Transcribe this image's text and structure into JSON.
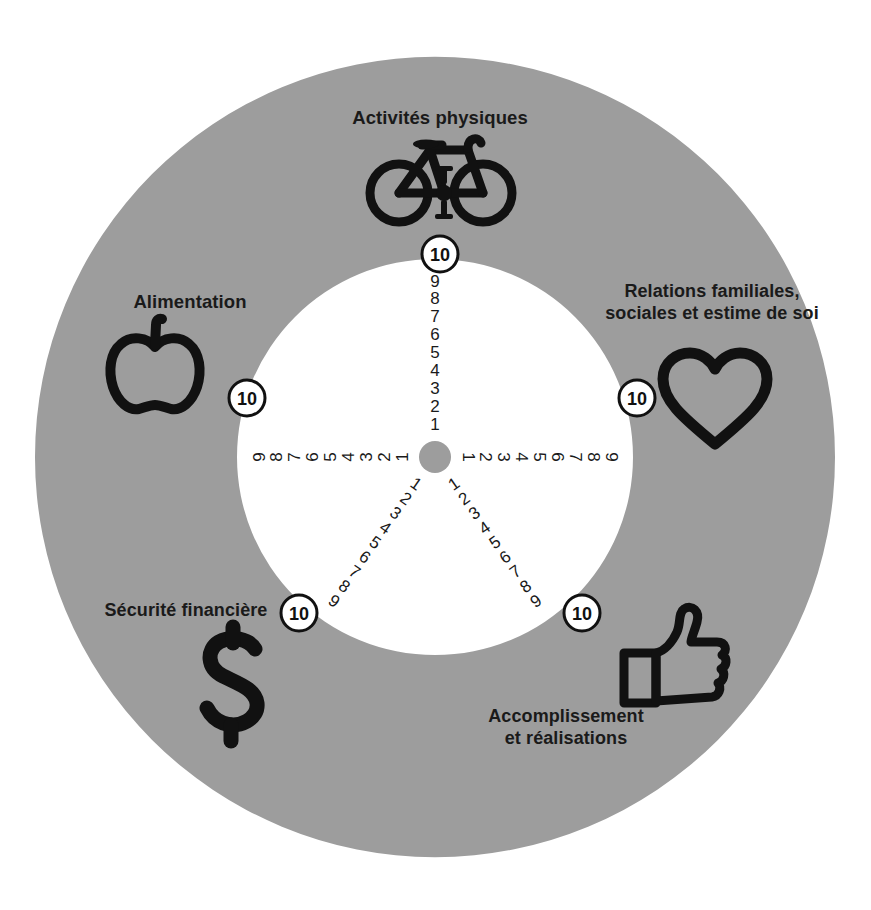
{
  "diagram": {
    "type": "radial-scale-wheel",
    "colors": {
      "ring": "#9d9d9d",
      "inner": "#ffffff",
      "hub": "#9d9d9d",
      "ink": "#1a1a1a",
      "background": "#ffffff"
    },
    "geometry": {
      "center_x": 435,
      "center_y": 457,
      "outer_radius": 400,
      "inner_radius": 198,
      "hub_radius": 16
    },
    "scale": {
      "min_label": "1",
      "max_label": "10",
      "tick_labels": [
        "1",
        "2",
        "3",
        "4",
        "5",
        "6",
        "7",
        "8",
        "9"
      ],
      "end_badge_label": "10"
    },
    "spokes": [
      {
        "id": "activites-physiques",
        "label": "Activités physiques",
        "icon": "bicycle-icon",
        "angle_deg": -90,
        "ticks": [
          "1",
          "2",
          "3",
          "4",
          "5",
          "6",
          "7",
          "8",
          "9"
        ],
        "badge": "10",
        "badge_x": 440,
        "badge_y": 254,
        "label_x": 440,
        "label_y": 117,
        "icon_x": 440,
        "icon_y": 178
      },
      {
        "id": "relations-familiales",
        "label": "Relations familiales,\nsociales et estime de soi",
        "icon": "heart-icon",
        "angle_deg": 0,
        "ticks": [
          "1",
          "2",
          "3",
          "4",
          "5",
          "6",
          "7",
          "8",
          "9"
        ],
        "badge": "10",
        "badge_x": 637,
        "badge_y": 398,
        "label_x": 712,
        "label_y": 303,
        "icon_x": 715,
        "icon_y": 402
      },
      {
        "id": "accomplissement",
        "label": "Accomplissement\net réalisations",
        "icon": "thumbs-up-icon",
        "angle_deg": 55,
        "ticks": [
          "1",
          "2",
          "3",
          "4",
          "5",
          "6",
          "7",
          "8",
          "9"
        ],
        "badge": "10",
        "badge_x": 582,
        "badge_y": 613,
        "label_x": 566,
        "label_y": 728,
        "icon_x": 670,
        "icon_y": 661
      },
      {
        "id": "securite-financiere",
        "label": "Sécurité financière",
        "icon": "dollar-icon",
        "angle_deg": 125,
        "ticks": [
          "1",
          "2",
          "3",
          "4",
          "5",
          "6",
          "7",
          "8",
          "9"
        ],
        "badge": "10",
        "badge_x": 299,
        "badge_y": 613,
        "label_x": 186,
        "label_y": 610,
        "icon_x": 233,
        "icon_y": 683
      },
      {
        "id": "alimentation",
        "label": "Alimentation",
        "icon": "apple-icon",
        "angle_deg": 180,
        "ticks": [
          "1",
          "2",
          "3",
          "4",
          "5",
          "6",
          "7",
          "8",
          "9"
        ],
        "badge": "10",
        "badge_x": 247,
        "badge_y": 398,
        "label_x": 190,
        "label_y": 302,
        "icon_x": 155,
        "icon_y": 373
      }
    ]
  },
  "chart_data": {
    "type": "radar-scale",
    "axes": [
      "Activités physiques",
      "Relations familiales, sociales et estime de soi",
      "Accomplissement et réalisations",
      "Sécurité financière",
      "Alimentation"
    ],
    "scale_min": 1,
    "scale_max": 10,
    "tick_labels": [
      "1",
      "2",
      "3",
      "4",
      "5",
      "6",
      "7",
      "8",
      "9",
      "10"
    ],
    "values": [
      null,
      null,
      null,
      null,
      null
    ],
    "legend": "none",
    "grid": false
  }
}
